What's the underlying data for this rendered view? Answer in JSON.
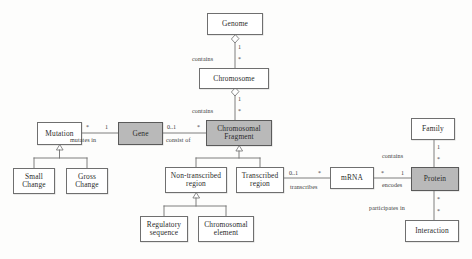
{
  "diagram": {
    "type": "uml-class-diagram",
    "colors": {
      "background": "#fdfdfc",
      "box_fill_plain": "#ffffff",
      "box_fill_highlight": "#b9b9b9",
      "box_border": "#6f6f6f",
      "line": "#6f6f6f",
      "text": "#2b2b2b"
    }
  },
  "nodes": [
    {
      "id": "genome",
      "label": "Genome",
      "filled": false,
      "x": 207,
      "y": 13,
      "w": 56,
      "h": 22
    },
    {
      "id": "chromosome",
      "label": "Chromosome",
      "filled": false,
      "x": 199,
      "y": 68,
      "w": 70,
      "h": 21
    },
    {
      "id": "chromosomal-fragment",
      "label": "Chromosomal\nFragment",
      "filled": true,
      "x": 206,
      "y": 120,
      "w": 66,
      "h": 26
    },
    {
      "id": "gene",
      "label": "Gene",
      "filled": true,
      "x": 118,
      "y": 122,
      "w": 45,
      "h": 23
    },
    {
      "id": "mutation",
      "label": "Mutation",
      "filled": false,
      "x": 37,
      "y": 122,
      "w": 45,
      "h": 23
    },
    {
      "id": "small-change",
      "label": "Small\nChange",
      "filled": false,
      "x": 13,
      "y": 168,
      "w": 42,
      "h": 26
    },
    {
      "id": "gross-change",
      "label": "Gross\nChange",
      "filled": false,
      "x": 66,
      "y": 168,
      "w": 42,
      "h": 26
    },
    {
      "id": "non-transcribed-region",
      "label": "Non-transcribed\nregion",
      "filled": false,
      "x": 165,
      "y": 167,
      "w": 62,
      "h": 26
    },
    {
      "id": "transcribed-region",
      "label": "Transcribed\nregion",
      "filled": false,
      "x": 236,
      "y": 167,
      "w": 48,
      "h": 26
    },
    {
      "id": "regulatory-sequence",
      "label": "Regulatory\nsequence",
      "filled": false,
      "x": 140,
      "y": 216,
      "w": 48,
      "h": 26
    },
    {
      "id": "chromosomal-element",
      "label": "Chromosomal\nelement",
      "filled": false,
      "x": 198,
      "y": 216,
      "w": 56,
      "h": 26
    },
    {
      "id": "mrna",
      "label": "mRNA",
      "filled": false,
      "x": 330,
      "y": 167,
      "w": 44,
      "h": 22
    },
    {
      "id": "protein",
      "label": "Protein",
      "filled": true,
      "x": 411,
      "y": 167,
      "w": 48,
      "h": 24
    },
    {
      "id": "family",
      "label": "Family",
      "filled": false,
      "x": 411,
      "y": 118,
      "w": 44,
      "h": 22
    },
    {
      "id": "interaction",
      "label": "Interaction",
      "filled": false,
      "x": 405,
      "y": 220,
      "w": 54,
      "h": 22
    }
  ],
  "edge_labels": [
    {
      "id": "contains-genome-chromosome",
      "text": "contains",
      "x": 192,
      "y": 56
    },
    {
      "id": "contains-chromosome-fragment",
      "text": "contains",
      "x": 192,
      "y": 108
    },
    {
      "id": "mutates-in",
      "text": "mutates in",
      "x": 70,
      "y": 137
    },
    {
      "id": "consist-of",
      "text": "consist of",
      "x": 166,
      "y": 137
    },
    {
      "id": "transcribes",
      "text": "transcribes",
      "x": 290,
      "y": 184
    },
    {
      "id": "encodes",
      "text": "encodes",
      "x": 382,
      "y": 182
    },
    {
      "id": "contains-family-protein",
      "text": "contains",
      "x": 382,
      "y": 153
    },
    {
      "id": "participates-in",
      "text": "participates in",
      "x": 369,
      "y": 205
    }
  ],
  "multiplicities": [
    {
      "id": "m-genome-1",
      "text": "1",
      "x": 238,
      "y": 44
    },
    {
      "id": "m-chromosome-star",
      "text": "*",
      "x": 238,
      "y": 56
    },
    {
      "id": "m-chromosome-1",
      "text": "1",
      "x": 238,
      "y": 96
    },
    {
      "id": "m-fragment-star",
      "text": "*",
      "x": 238,
      "y": 108
    },
    {
      "id": "m-mutation-star",
      "text": "*",
      "x": 86,
      "y": 124
    },
    {
      "id": "m-gene-1",
      "text": "1",
      "x": 105,
      "y": 124
    },
    {
      "id": "m-gene-0-1",
      "text": "0..1",
      "x": 167,
      "y": 124
    },
    {
      "id": "m-fragment-star-left",
      "text": "*",
      "x": 197,
      "y": 124
    },
    {
      "id": "m-transcribed-0-1",
      "text": "0..1",
      "x": 289,
      "y": 170
    },
    {
      "id": "m-mrna-star-left",
      "text": "*",
      "x": 318,
      "y": 170
    },
    {
      "id": "m-mrna-star-right",
      "text": "*",
      "x": 381,
      "y": 170
    },
    {
      "id": "m-protein-1",
      "text": "1",
      "x": 401,
      "y": 170
    },
    {
      "id": "m-family-1",
      "text": "1",
      "x": 437,
      "y": 144
    },
    {
      "id": "m-protein-star-top",
      "text": "*",
      "x": 437,
      "y": 156
    },
    {
      "id": "m-protein-star-bottom",
      "text": "*",
      "x": 437,
      "y": 196
    },
    {
      "id": "m-interaction-star",
      "text": "*",
      "x": 437,
      "y": 208
    }
  ],
  "relationships": [
    {
      "id": "rel-genome-chromosome",
      "from": "genome",
      "to": "chromosome",
      "kind": "aggregation",
      "label": "contains"
    },
    {
      "id": "rel-chromosome-fragment",
      "from": "chromosome",
      "to": "chromosomal-fragment",
      "kind": "aggregation",
      "label": "contains"
    },
    {
      "id": "rel-mutation-gene",
      "from": "mutation",
      "to": "gene",
      "kind": "association",
      "label": "mutates in"
    },
    {
      "id": "rel-gene-fragment",
      "from": "gene",
      "to": "chromosomal-fragment",
      "kind": "association",
      "label": "consist of"
    },
    {
      "id": "rel-mutation-subclasses",
      "from": "mutation",
      "to": "small-change, gross-change",
      "kind": "generalization",
      "label": ""
    },
    {
      "id": "rel-fragment-subclasses",
      "from": "chromosomal-fragment",
      "to": "non-transcribed-region, transcribed-region",
      "kind": "generalization",
      "label": ""
    },
    {
      "id": "rel-nontranscribed-subs",
      "from": "non-transcribed-region",
      "to": "regulatory-sequence, chromosomal-element",
      "kind": "generalization",
      "label": ""
    },
    {
      "id": "rel-transcribed-mrna",
      "from": "transcribed-region",
      "to": "mrna",
      "kind": "association",
      "label": "transcribes"
    },
    {
      "id": "rel-mrna-protein",
      "from": "mrna",
      "to": "protein",
      "kind": "association",
      "label": "encodes"
    },
    {
      "id": "rel-family-protein",
      "from": "family",
      "to": "protein",
      "kind": "association",
      "label": "contains"
    },
    {
      "id": "rel-protein-interaction",
      "from": "protein",
      "to": "interaction",
      "kind": "association",
      "label": "participates in"
    }
  ]
}
